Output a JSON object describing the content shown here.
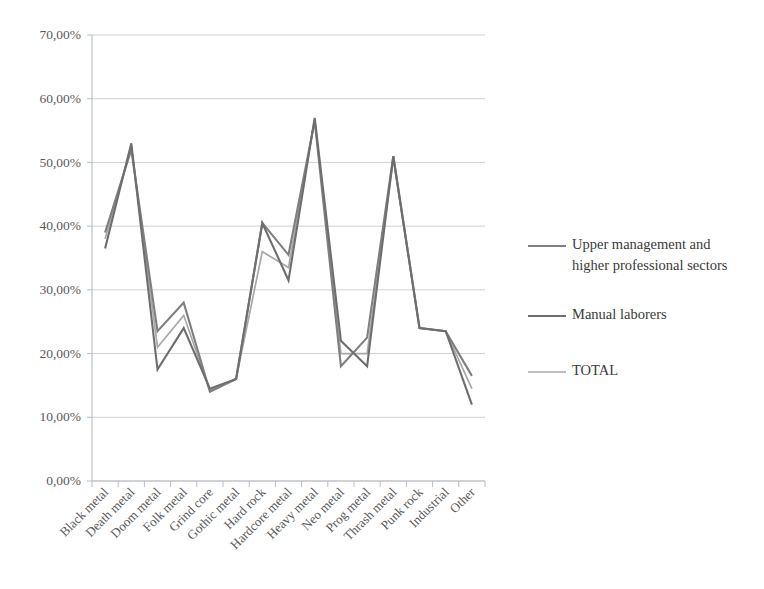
{
  "chart_data": {
    "type": "line",
    "title": "",
    "subtitle": "",
    "xlabel": "",
    "ylabel": "",
    "grid": true,
    "legend_position": "right",
    "ylim": [
      0,
      70
    ],
    "ytick_labels": [
      "0,00%",
      "10,00%",
      "20,00%",
      "30,00%",
      "40,00%",
      "50,00%",
      "60,00%",
      "70,00%"
    ],
    "ytick_values": [
      0,
      10,
      20,
      30,
      40,
      50,
      60,
      70
    ],
    "categories": [
      "Black metal",
      "Death metal",
      "Doom metal",
      "Folk metal",
      "Grind core",
      "Gothic metal",
      "Hard rock",
      "Hardcore metal",
      "Heavy metal",
      "Neo metal",
      "Prog metal",
      "Thrash metal",
      "Punk rock",
      "Industrial",
      "Other"
    ],
    "series": [
      {
        "name": "Upper management and higher professional sectors",
        "color": "#7f7f7f",
        "width": 2.1,
        "values": [
          39.0,
          52.0,
          23.5,
          28.0,
          14.0,
          16.0,
          40.5,
          35.5,
          56.5,
          18.0,
          22.5,
          51.0,
          24.0,
          23.5,
          16.5
        ]
      },
      {
        "name": "Manual laborers",
        "color": "#6e6e6e",
        "width": 2.1,
        "values": [
          36.5,
          53.0,
          17.5,
          24.0,
          14.5,
          16.0,
          40.5,
          31.5,
          57.0,
          22.0,
          18.0,
          51.0,
          24.0,
          23.5,
          12.0
        ]
      },
      {
        "name": "TOTAL",
        "color": "#a8a8a8",
        "width": 1.7,
        "values": [
          38.0,
          52.5,
          21.0,
          26.0,
          14.2,
          16.0,
          36.0,
          33.5,
          56.8,
          20.0,
          20.0,
          50.5,
          24.0,
          23.5,
          14.5
        ]
      }
    ]
  },
  "legend": {
    "entries": [
      {
        "label_line1": "Upper management and",
        "label_line2": "higher professional sectors",
        "swatch": "legend-swatch-upper-management"
      },
      {
        "label_line1": "Manual laborers",
        "label_line2": "",
        "swatch": "legend-swatch-manual-laborers"
      },
      {
        "label_line1": "TOTAL",
        "label_line2": "",
        "swatch": "legend-swatch-total"
      }
    ]
  }
}
